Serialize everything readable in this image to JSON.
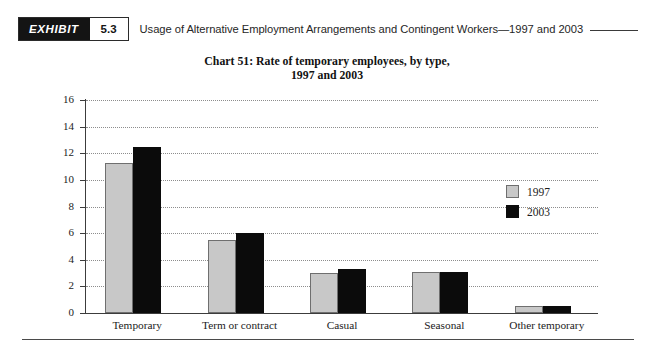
{
  "header": {
    "badge_word": "EXHIBIT",
    "badge_number": "5.3",
    "title": "Usage of Alternative Employment Arrangements and Contingent Workers—1997 and 2003"
  },
  "chart_data": {
    "type": "bar",
    "title_line1": "Chart 51: Rate of temporary employees, by type,",
    "title_line2": "1997 and 2003",
    "title": "Chart 51: Rate of temporary employees, by type, 1997 and 2003",
    "xlabel": "",
    "ylabel": "",
    "ylim": [
      0,
      16
    ],
    "ytick_values": [
      0,
      2,
      4,
      6,
      8,
      10,
      12,
      14,
      16
    ],
    "ytick_labels": [
      "0",
      "2",
      "4",
      "6",
      "8",
      "10",
      "12",
      "14",
      "16"
    ],
    "grid": true,
    "legend_position": "inside-right",
    "categories": [
      "Temporary",
      "Term or contract",
      "Casual",
      "Seasonal",
      "Other temporary"
    ],
    "series": [
      {
        "name": "1997",
        "color": "#c8c8c8",
        "values": [
          11.3,
          5.5,
          3.0,
          3.1,
          0.5
        ]
      },
      {
        "name": "2003",
        "color": "#0b0b0b",
        "values": [
          12.5,
          6.0,
          3.3,
          3.1,
          0.5
        ]
      }
    ]
  }
}
